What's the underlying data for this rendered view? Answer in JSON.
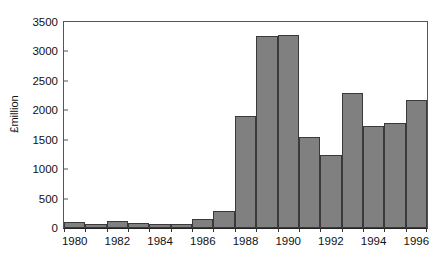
{
  "chart_data": {
    "type": "bar",
    "title": "",
    "subtitle": "",
    "xlabel": "",
    "ylabel": "£million",
    "categories": [
      1980,
      1981,
      1982,
      1983,
      1984,
      1985,
      1986,
      1987,
      1988,
      1989,
      1990,
      1991,
      1992,
      1993,
      1994,
      1995,
      1996
    ],
    "values": [
      95,
      65,
      125,
      80,
      60,
      70,
      155,
      285,
      1900,
      3260,
      3280,
      1540,
      1240,
      2290,
      1740,
      1785,
      2170
    ],
    "ylim": [
      0,
      3500
    ],
    "yticks": [
      0,
      500,
      1000,
      1500,
      2000,
      2500,
      3000,
      3500
    ],
    "ytick_labels": [
      "0",
      "500",
      "1000",
      "1500",
      "2000",
      "2500",
      "3000",
      "3500"
    ],
    "xticks": [
      1980,
      1981,
      1982,
      1983,
      1984,
      1985,
      1986,
      1987,
      1988,
      1989,
      1990,
      1991,
      1992,
      1993,
      1994,
      1995,
      1996
    ],
    "xtick_labels": [
      "1980",
      "",
      "1982",
      "",
      "1984",
      "",
      "1986",
      "",
      "1988",
      "",
      "1990",
      "",
      "1992",
      "",
      "1994",
      "",
      "1996"
    ],
    "grid": false,
    "legend": null,
    "legend_position": "none",
    "bar_color": "#808080",
    "bar_edge_color": "#3a3a3a",
    "axis_color": "#555555",
    "background_color": "#ffffff",
    "text_color": "#111111"
  }
}
